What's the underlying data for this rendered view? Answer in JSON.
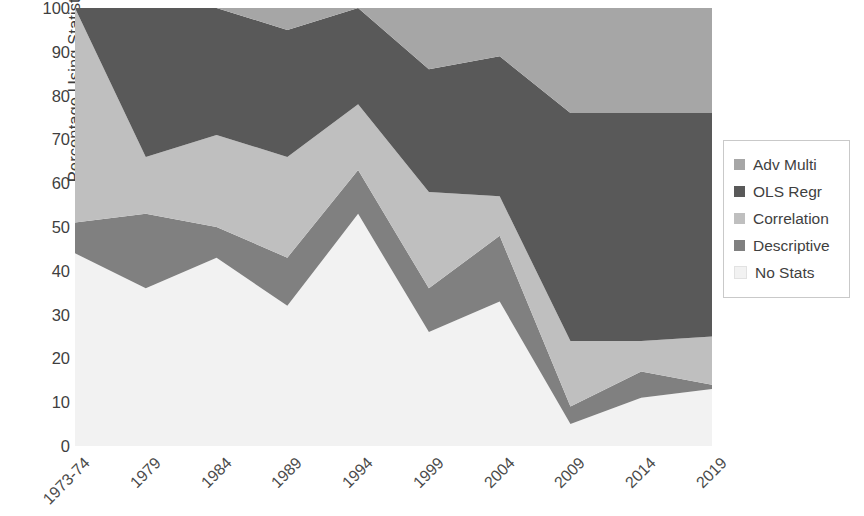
{
  "chart_data": {
    "type": "area",
    "subtype": "100% stacked area",
    "title": "",
    "xlabel": "",
    "ylabel": "Percentage Using Statistical Method",
    "ylim": [
      0,
      100
    ],
    "yticks": [
      0,
      10,
      20,
      30,
      40,
      50,
      60,
      70,
      80,
      90,
      100
    ],
    "grid": false,
    "legend_position": "right",
    "categories": [
      "1973-74",
      "1979",
      "1984",
      "1989",
      "1994",
      "1999",
      "2004",
      "2009",
      "2014",
      "2019"
    ],
    "series": [
      {
        "name": "No Stats",
        "color": "#f2f2f2",
        "values": [
          44,
          36,
          43,
          32,
          53,
          26,
          33,
          5,
          11,
          13
        ]
      },
      {
        "name": "Descriptive",
        "color": "#808080",
        "values": [
          7,
          17,
          7,
          11,
          10,
          10,
          15,
          4,
          6,
          1
        ]
      },
      {
        "name": "Correlation",
        "color": "#bfbfbf",
        "values": [
          49,
          13,
          21,
          23,
          15,
          22,
          9,
          15,
          7,
          11
        ]
      },
      {
        "name": "OLS Regr",
        "color": "#595959",
        "values": [
          0,
          34,
          29,
          29,
          22,
          28,
          32,
          52,
          52,
          51
        ]
      },
      {
        "name": "Adv Multi",
        "color": "#a6a6a6",
        "values": [
          0,
          0,
          0,
          5,
          0,
          14,
          11,
          24,
          24,
          24
        ]
      }
    ],
    "cumulative_tops": {
      "no_stats": [
        44,
        36,
        43,
        32,
        53,
        26,
        33,
        5,
        11,
        13
      ],
      "descriptive": [
        51,
        53,
        50,
        43,
        63,
        36,
        48,
        9,
        17,
        14
      ],
      "correlation": [
        100,
        66,
        71,
        66,
        78,
        58,
        57,
        24,
        24,
        25
      ],
      "ols_regr": [
        100,
        100,
        100,
        95,
        100,
        86,
        89,
        48,
        76,
        76
      ],
      "adv_multi": [
        100,
        100,
        100,
        100,
        100,
        100,
        100,
        100,
        100,
        100
      ]
    }
  },
  "axis": {
    "y_title": "Percentage Using Statistical Method",
    "y_tick_labels": [
      "100",
      "90",
      "80",
      "70",
      "60",
      "50",
      "40",
      "30",
      "20",
      "10",
      "0"
    ],
    "x_tick_labels": [
      "1973-74",
      "1979",
      "1984",
      "1989",
      "1994",
      "1999",
      "2004",
      "2009",
      "2014",
      "2019"
    ]
  },
  "legend": {
    "items": [
      {
        "label": "Adv Multi",
        "color": "#a6a6a6"
      },
      {
        "label": "OLS Regr",
        "color": "#595959"
      },
      {
        "label": "Correlation",
        "color": "#bfbfbf"
      },
      {
        "label": "Descriptive",
        "color": "#808080"
      },
      {
        "label": "No Stats",
        "color": "#f2f2f2"
      }
    ]
  },
  "colors": {
    "adv_multi": "#a6a6a6",
    "ols_regr": "#595959",
    "correlation": "#bfbfbf",
    "descriptive": "#808080",
    "no_stats": "#f2f2f2",
    "text": "#3f3f3f",
    "legend_border": "#c9c9c9",
    "background": "#ffffff"
  }
}
